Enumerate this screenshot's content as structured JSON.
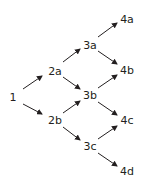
{
  "diagram": {
    "type": "lattice/tree",
    "colors": {
      "text": "#231f20",
      "arrow": "#231f20",
      "background": "#ffffff"
    },
    "nodes": [
      {
        "id": "1",
        "label": "1",
        "x": 13,
        "y": 97
      },
      {
        "id": "2a",
        "label": "2a",
        "x": 55,
        "y": 71
      },
      {
        "id": "2b",
        "label": "2b",
        "x": 55,
        "y": 120
      },
      {
        "id": "3a",
        "label": "3a",
        "x": 90,
        "y": 45
      },
      {
        "id": "3b",
        "label": "3b",
        "x": 90,
        "y": 95
      },
      {
        "id": "3c",
        "label": "3c",
        "x": 90,
        "y": 146
      },
      {
        "id": "4a",
        "label": "4a",
        "x": 127,
        "y": 19
      },
      {
        "id": "4b",
        "label": "4b",
        "x": 127,
        "y": 70
      },
      {
        "id": "4c",
        "label": "4c",
        "x": 127,
        "y": 120
      },
      {
        "id": "4d",
        "label": "4d",
        "x": 127,
        "y": 171
      }
    ],
    "edges": [
      {
        "from": "1",
        "to": "2a",
        "x1": 23,
        "y1": 89,
        "x2": 42,
        "y2": 76
      },
      {
        "from": "1",
        "to": "2b",
        "x1": 23,
        "y1": 104,
        "x2": 42,
        "y2": 114
      },
      {
        "from": "2a",
        "to": "3a",
        "x1": 63,
        "y1": 62,
        "x2": 80,
        "y2": 49
      },
      {
        "from": "2a",
        "to": "3b",
        "x1": 63,
        "y1": 77,
        "x2": 80,
        "y2": 89
      },
      {
        "from": "2b",
        "to": "3b",
        "x1": 63,
        "y1": 113,
        "x2": 80,
        "y2": 101
      },
      {
        "from": "2b",
        "to": "3c",
        "x1": 63,
        "y1": 127,
        "x2": 80,
        "y2": 140
      },
      {
        "from": "3a",
        "to": "4a",
        "x1": 98,
        "y1": 37,
        "x2": 117,
        "y2": 23
      },
      {
        "from": "3a",
        "to": "4b",
        "x1": 98,
        "y1": 51,
        "x2": 117,
        "y2": 64
      },
      {
        "from": "3b",
        "to": "4b",
        "x1": 98,
        "y1": 88,
        "x2": 117,
        "y2": 75
      },
      {
        "from": "3b",
        "to": "4c",
        "x1": 98,
        "y1": 102,
        "x2": 117,
        "y2": 115
      },
      {
        "from": "3c",
        "to": "4c",
        "x1": 98,
        "y1": 139,
        "x2": 117,
        "y2": 126
      },
      {
        "from": "3c",
        "to": "4d",
        "x1": 98,
        "y1": 153,
        "x2": 117,
        "y2": 166
      }
    ]
  }
}
